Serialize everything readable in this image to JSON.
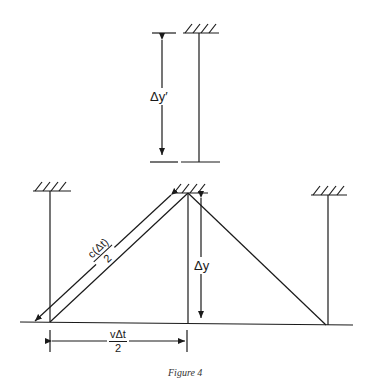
{
  "figure": {
    "caption": "Figure 4",
    "colors": {
      "ink": "#1a1a1a",
      "background": "#ffffff"
    }
  },
  "labels": {
    "delta_y_prime": "Δy′",
    "delta_y": "Δy",
    "hypotenuse_num": "c(Δt)",
    "hypotenuse_den": "2",
    "base_num": "vΔt",
    "base_den": "2"
  },
  "elements": {
    "top_clock": {
      "ceiling": "hatched",
      "rod": "vertical",
      "dimension": "delta_y_prime"
    },
    "bottom_clocks": [
      "left",
      "middle",
      "right"
    ],
    "light_path": [
      "left-bottom",
      "middle-top",
      "right-bottom"
    ]
  }
}
